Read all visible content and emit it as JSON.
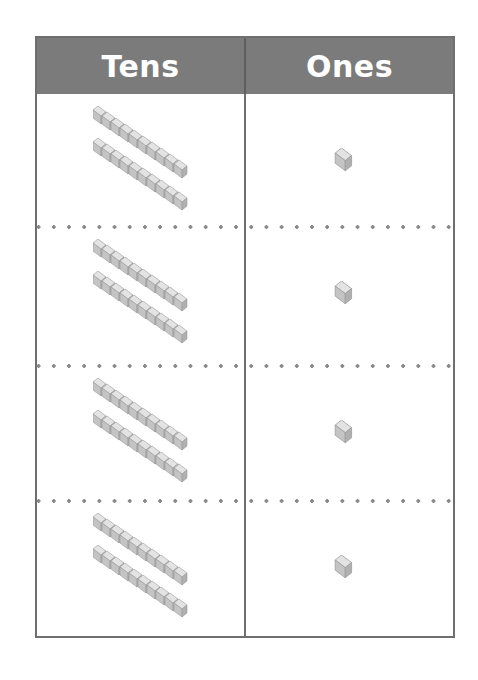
{
  "table": {
    "headers": {
      "tens": "Tens",
      "ones": "Ones"
    },
    "header_color": "#7b7b7b",
    "rows": [
      {
        "tens": 2,
        "ones": 1
      },
      {
        "tens": 2,
        "ones": 1
      },
      {
        "tens": 2,
        "ones": 1
      },
      {
        "tens": 2,
        "ones": 1
      }
    ]
  },
  "icons": {
    "ten_rod": "ten-rod-block-icon",
    "unit_cube": "unit-cube-icon"
  }
}
